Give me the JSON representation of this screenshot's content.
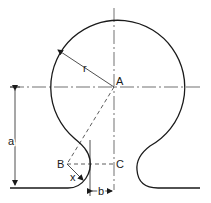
{
  "diagram": {
    "type": "geometric-construction",
    "points": {
      "A": "A",
      "B": "B",
      "C": "C"
    },
    "dimensions": {
      "radius": "r",
      "height": "a",
      "offset": "b",
      "fillet": "x"
    },
    "colors": {
      "stroke": "#1a1a1a",
      "background": "#ffffff"
    }
  }
}
